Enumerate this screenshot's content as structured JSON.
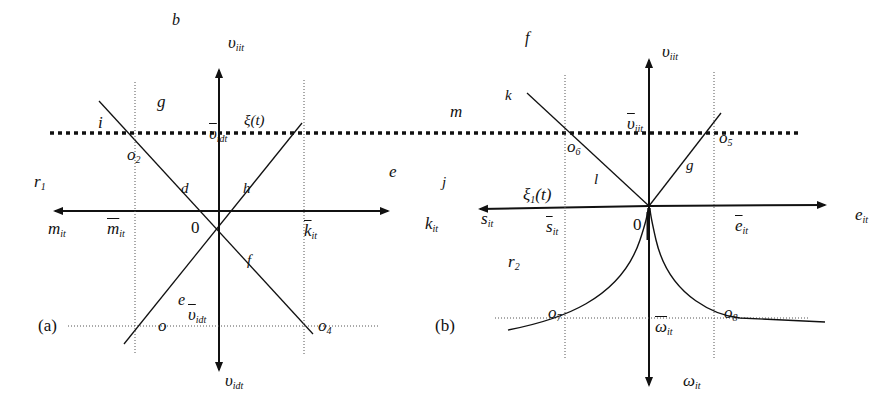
{
  "panel_a": {
    "caption": "(a)",
    "axis_up": "υ",
    "axis_up_sub": "iit",
    "axis_down": "υ",
    "axis_down_sub": "idt",
    "axis_left": "m",
    "axis_left_sub": "it",
    "axis_right": "k",
    "axis_right_sub": "it",
    "origin": "0",
    "bar_up": "υ",
    "bar_up_sub": "idt",
    "bar_down": "υ",
    "bar_down_sub": "idt",
    "bar_left": "m",
    "bar_left_sub": "it",
    "bar_right": "k",
    "bar_right_sub": "it",
    "xi_label": "ξ(t)",
    "region_labels": [
      "b",
      "g",
      "i",
      "r",
      "d",
      "h",
      "e",
      "f",
      "e"
    ],
    "r_sub": "1",
    "points": [
      "o",
      "o",
      "o"
    ],
    "point_subs": [
      "2",
      "",
      "4"
    ]
  },
  "panel_b": {
    "caption": "(b)",
    "axis_up": "υ",
    "axis_up_sub": "iit",
    "axis_down": "ω",
    "axis_down_sub": "it",
    "axis_left": "s",
    "axis_left_sub": "it",
    "axis_right": "e",
    "axis_right_sub": "it",
    "origin": "0",
    "bar_up": "υ",
    "bar_up_sub": "iit",
    "bar_down": "ω",
    "bar_down_sub": "it",
    "bar_left": "s",
    "bar_left_sub": "it",
    "bar_right": "e",
    "bar_right_sub": "it",
    "xi_label": "ξ",
    "xi_sub": "1",
    "xi_tail": "(t)",
    "region_labels": [
      "f",
      "k",
      "m",
      "j",
      "l",
      "g",
      "r"
    ],
    "r_sub": "2",
    "points": [
      "o",
      "o",
      "o",
      "o"
    ],
    "point_subs": [
      "6",
      "5",
      "7",
      "8"
    ]
  }
}
